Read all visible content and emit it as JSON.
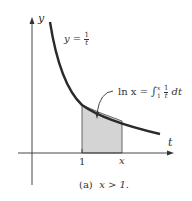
{
  "figure": {
    "axis_y_label": "y",
    "axis_x_label": "t",
    "curve_label_lhs": "y =",
    "curve_label_num": "1",
    "curve_label_den": "t",
    "integral_lhs": "ln x =",
    "integral_sign": "∫",
    "integral_upper": "x",
    "integral_lower": "1",
    "integral_num": "1",
    "integral_den": "t",
    "integral_dt": "dt",
    "tick_one": "1",
    "tick_x": "x",
    "caption_tag": "(a)",
    "caption_text": "x > 1."
  },
  "colors": {
    "curve": "#2a2a2a",
    "axis": "#333333",
    "shade": "#d4d4d4"
  }
}
